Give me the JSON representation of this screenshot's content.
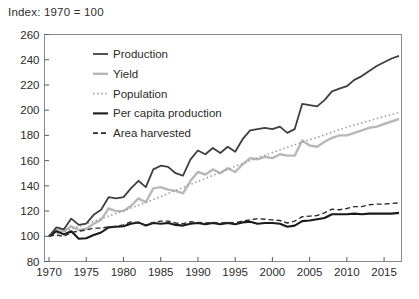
{
  "title": "Index: 1970 = 100",
  "chart_data": {
    "type": "line",
    "title": "Index: 1970 = 100",
    "xlabel": "",
    "ylabel": "",
    "grid": false,
    "legend_position": "top-left-inside",
    "ylim": [
      80,
      260
    ],
    "yticks": [
      80,
      100,
      120,
      140,
      160,
      180,
      200,
      220,
      240,
      260
    ],
    "xticks": [
      1970,
      1975,
      1980,
      1985,
      1990,
      1995,
      2000,
      2005,
      2010,
      2015
    ],
    "x": [
      1970,
      1971,
      1972,
      1973,
      1974,
      1975,
      1976,
      1977,
      1978,
      1979,
      1980,
      1981,
      1982,
      1983,
      1984,
      1985,
      1986,
      1987,
      1988,
      1989,
      1990,
      1991,
      1992,
      1993,
      1994,
      1995,
      1996,
      1997,
      1998,
      1999,
      2000,
      2001,
      2002,
      2003,
      2004,
      2005,
      2006,
      2007,
      2008,
      2009,
      2010,
      2011,
      2012,
      2013,
      2014,
      2015,
      2016,
      2017
    ],
    "series": [
      {
        "name": "Production",
        "color": "#3f3f3f",
        "width": 1.8,
        "dash": "solid",
        "values": [
          100,
          107,
          105.5,
          114,
          109,
          110,
          117,
          121,
          131,
          130,
          131,
          138,
          144,
          139,
          153,
          156,
          155,
          150,
          148,
          161,
          168,
          165,
          170,
          166,
          171,
          167,
          177,
          184,
          185,
          186,
          185,
          187,
          182,
          185,
          205,
          204,
          203,
          208,
          215,
          217,
          219,
          224,
          227,
          231,
          235,
          238,
          241,
          243
        ]
      },
      {
        "name": "Yield",
        "color": "#b8b8b8",
        "width": 2.4,
        "dash": "solid",
        "values": [
          100,
          105,
          104,
          108,
          105,
          106,
          110,
          113,
          122,
          120,
          120,
          124,
          130,
          127,
          138,
          139,
          137,
          136,
          134,
          144,
          151,
          149,
          153,
          150,
          154,
          151,
          157,
          162,
          161,
          163,
          162,
          165,
          164,
          164,
          176,
          172,
          171,
          175,
          178,
          180,
          180,
          182,
          184,
          186,
          187,
          189,
          191,
          193
        ]
      },
      {
        "name": "Population",
        "color": "#9e9e9e",
        "width": 1.6,
        "dash": "dotted",
        "values": [
          100,
          101.9,
          103.8,
          105.8,
          107.8,
          109.8,
          111.8,
          113.9,
          116,
          118.1,
          120.2,
          122.4,
          124.6,
          126.9,
          129.2,
          131.5,
          133.9,
          136.3,
          138.7,
          141.1,
          143.5,
          145.9,
          148.3,
          150.7,
          153.1,
          155.5,
          157.7,
          159.9,
          162.1,
          164.3,
          166.5,
          168.5,
          170.5,
          172.5,
          174.5,
          176.5,
          178.5,
          180.5,
          182.5,
          184.5,
          186.5,
          188.2,
          189.9,
          191.6,
          193.3,
          195,
          196.5,
          198
        ]
      },
      {
        "name": "Per capita production",
        "color": "#1a1a1a",
        "width": 2.1,
        "dash": "solid",
        "values": [
          100,
          104,
          101.5,
          104,
          98,
          98.5,
          101,
          103,
          107,
          107.5,
          108,
          110,
          111,
          108.5,
          110.5,
          110,
          110.5,
          109,
          108.5,
          110,
          110.5,
          109.5,
          110.5,
          109.5,
          110.5,
          109.5,
          111,
          111.5,
          110,
          110.5,
          110.5,
          110,
          107.5,
          108.5,
          112,
          112.5,
          113.5,
          114.5,
          117.5,
          117.5,
          117.5,
          118,
          117.5,
          118,
          118,
          118,
          118,
          118.5
        ]
      },
      {
        "name": "Area harvested",
        "color": "#2b2b2b",
        "width": 1.4,
        "dash": "dashed",
        "values": [
          100,
          101,
          100,
          103,
          104,
          105,
          106.5,
          106.5,
          107.5,
          108,
          109,
          111.5,
          110.5,
          109,
          111,
          112,
          112,
          110.5,
          110,
          111.5,
          111,
          110.5,
          111,
          110.5,
          111,
          110.5,
          112,
          113,
          114,
          113.5,
          113,
          112.5,
          110.5,
          112,
          115.5,
          116,
          116.5,
          118.5,
          121.5,
          121,
          122,
          123.5,
          123.5,
          125,
          125.5,
          125.5,
          126,
          126.5
        ]
      }
    ]
  }
}
